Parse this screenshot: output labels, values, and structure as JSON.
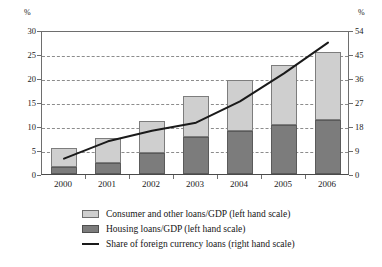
{
  "axes": {
    "left_unit": "%",
    "right_unit": "%",
    "left_ticks": [
      "0",
      "5",
      "10",
      "15",
      "20",
      "25",
      "30"
    ],
    "right_ticks": [
      "0",
      "9",
      "18",
      "27",
      "36",
      "45",
      "54"
    ]
  },
  "legend": [
    {
      "swatch": "light-gray-square",
      "label": "Consumer and other loans/GDP (left hand scale)"
    },
    {
      "swatch": "dark-gray-square",
      "label": "Housing loans/GDP (left hand scale)"
    },
    {
      "swatch": "black-line",
      "label": "Share of foreign currency loans (right hand scale)"
    }
  ],
  "chart_data": {
    "type": "bar",
    "title": "",
    "xlabel": "",
    "ylabel": "%",
    "categories": [
      "2000",
      "2001",
      "2002",
      "2003",
      "2004",
      "2005",
      "2006"
    ],
    "ylim": [
      0,
      30
    ],
    "y2lim": [
      0,
      54
    ],
    "grid": true,
    "legend_position": "bottom",
    "series": [
      {
        "name": "Housing loans/GDP (left hand scale)",
        "type": "bar",
        "stack": "loans",
        "axis": "left",
        "color": "#7c7c7c",
        "values": [
          1.5,
          2.2,
          4.4,
          7.8,
          9.0,
          10.2,
          11.2
        ]
      },
      {
        "name": "Consumer and other loans/GDP (left hand scale)",
        "type": "bar",
        "stack": "loans",
        "axis": "left",
        "color": "#cfcfcf",
        "values": [
          4.0,
          5.3,
          6.7,
          8.4,
          10.5,
          12.5,
          14.2
        ]
      },
      {
        "name": "Share of foreign currency loans (right hand scale)",
        "type": "line",
        "axis": "right",
        "color": "#1a1a1a",
        "values": [
          6.5,
          13.0,
          17.0,
          20.0,
          28.0,
          38.5,
          50.0
        ]
      }
    ],
    "stacked_totals": [
      5.5,
      7.5,
      11.1,
      16.2,
      19.5,
      22.7,
      25.4
    ]
  }
}
